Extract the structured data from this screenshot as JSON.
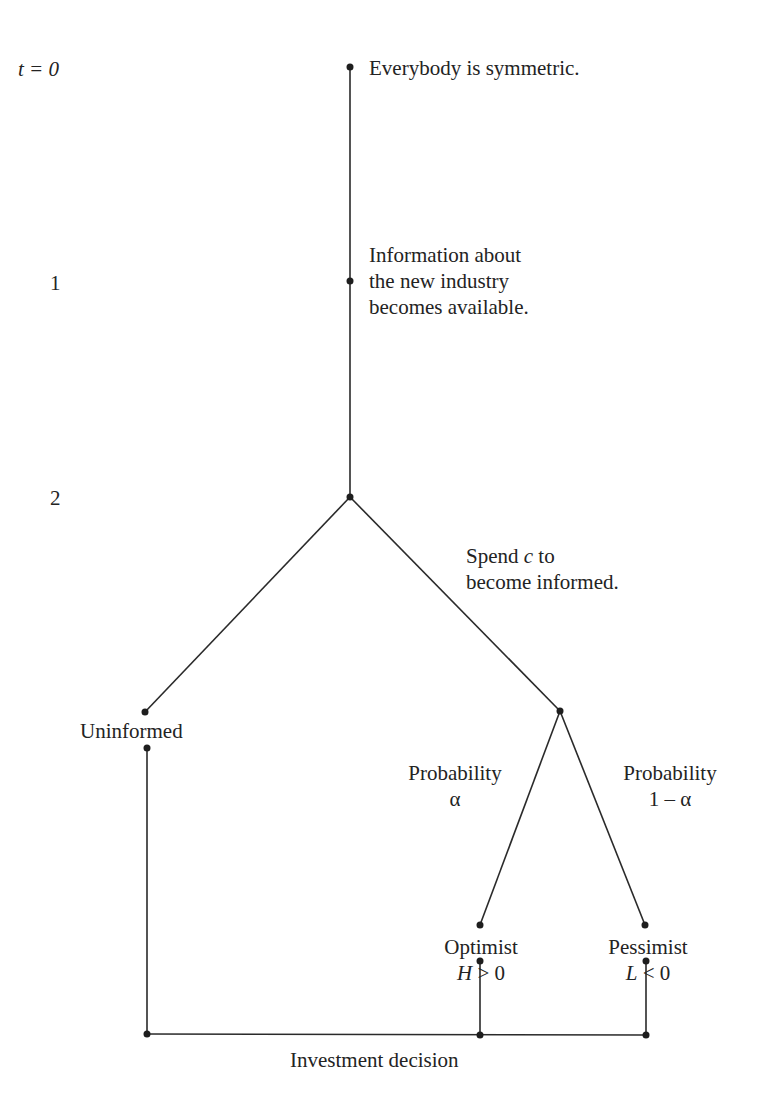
{
  "time_axis": {
    "t0": "t = 0",
    "t1": "1",
    "t2": "2"
  },
  "nodes": {
    "start": "Everybody is symmetric.",
    "information": "Information about\nthe new industry\nbecomes available.",
    "spend": {
      "pre": "Spend ",
      "var": "c",
      "post": " to",
      "line2": "become informed."
    },
    "uninformed": "Uninformed",
    "prob_alpha": "Probability\nα",
    "prob_one_minus_alpha": "Probability\n1 – α",
    "optimist": {
      "label": "Optimist",
      "var": "H",
      "cond": " > 0"
    },
    "pessimist": {
      "label": "Pessimist",
      "var": "L",
      "cond": " < 0"
    },
    "investment": "Investment decision"
  },
  "colors": {
    "line": "#2a2a2a",
    "text": "#232323"
  }
}
